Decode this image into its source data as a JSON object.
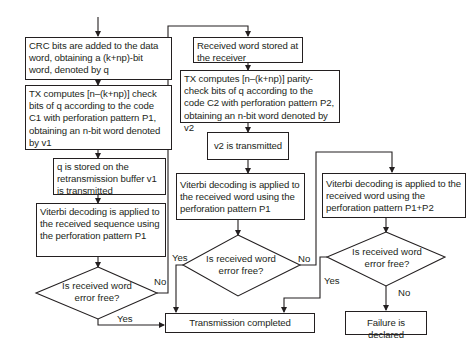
{
  "left_column": {
    "box1": "CRC bits are added to the data word, obtaining a (k+np)-bit word, denoted by q",
    "box2": "TX computes [n–(k+np)] check bits of q according to the code C1 with perforation pattern P1, obtaining an n-bit word denoted by v1",
    "box3": "q is stored on the retransmission buffer v1 is transmitted",
    "box4": "Viterbi decoding is applied to the received sequence using the perforation pattern P1",
    "decision1": "Is received word error free?",
    "decision1_yes": "Yes",
    "decision1_no": "No"
  },
  "middle_column": {
    "box5": "Received word stored at the receiver",
    "box6": "TX computes [n–(k+np)] parity-check bits of q according to the code C2 with perforation pattern P2, obtaining an n-bit word denoted by v2",
    "box7": "v2 is transmitted",
    "box8": "Viterbi decoding is applied to the received word using the perforation pattern P1",
    "decision2": "Is received word error free?",
    "decision2_yes": "Yes",
    "decision2_no": "No"
  },
  "right_column": {
    "box9": "Viterbi decoding is applied to the received word using the perforation pattern P1+P2",
    "decision3": "Is received word error free?",
    "decision3_yes": "Yes",
    "decision3_no": "No"
  },
  "terminals": {
    "completed": "Transmission completed",
    "failure": "Failure is declared"
  },
  "colors": {
    "stroke": "#231f20",
    "background": "#ffffff"
  }
}
